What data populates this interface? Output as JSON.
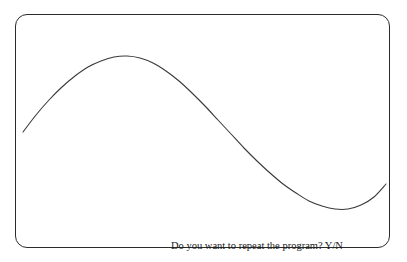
{
  "window": {
    "name": "graphics-output-window",
    "background_color": "#ffffff",
    "border_color": "#2b2b2b",
    "corner_radius_px": 12
  },
  "prompt": {
    "text": "Do you want to repeat the program? Y/N",
    "color": "#1a1a1a"
  },
  "chart_data": {
    "type": "line",
    "title": "",
    "xlabel": "",
    "ylabel": "",
    "grid": false,
    "legend": null,
    "line_color": "#3a3a3a",
    "line_width": 1.1,
    "xlim": [
      0,
      375
    ],
    "ylim": [
      0,
      234
    ],
    "x": [
      7,
      20,
      33,
      46,
      59,
      72,
      85,
      98,
      111,
      124,
      137,
      150,
      163,
      176,
      189,
      202,
      215,
      228,
      241,
      254,
      267,
      280,
      293,
      306,
      319,
      332,
      345,
      358,
      370
    ],
    "y": [
      117,
      100,
      85,
      72,
      61,
      52,
      46,
      42,
      41,
      43,
      48,
      56,
      66,
      78,
      91,
      105,
      119,
      133,
      146,
      158,
      169,
      178,
      186,
      191,
      194,
      194,
      190,
      182,
      169
    ],
    "points": [
      {
        "label": "start",
        "x": 7,
        "y": 117
      },
      {
        "label": "peak",
        "x": 85,
        "y": 41
      },
      {
        "label": "midline-crossing",
        "x": 180,
        "y": 117
      },
      {
        "label": "trough",
        "x": 273,
        "y": 194
      },
      {
        "label": "end",
        "x": 370,
        "y": 115
      }
    ]
  }
}
